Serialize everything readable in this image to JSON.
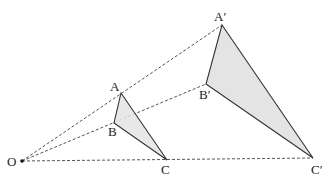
{
  "diagram": {
    "colors": {
      "fill": "#e4e4e4",
      "stroke": "#333333",
      "dash": "#555555"
    },
    "points": {
      "O": {
        "label": "O",
        "x": 22,
        "y": 161
      },
      "A": {
        "label": "A",
        "x": 121,
        "y": 93
      },
      "B": {
        "label": "B",
        "x": 114,
        "y": 123
      },
      "C": {
        "label": "C",
        "x": 167,
        "y": 160
      },
      "A_prime": {
        "label": "A′",
        "x": 222,
        "y": 25
      },
      "B_prime": {
        "label": "B′",
        "x": 206,
        "y": 84
      },
      "C_prime": {
        "label": "C′",
        "x": 313,
        "y": 158
      }
    },
    "rays": [
      "O-A′",
      "O-B′",
      "O-C′"
    ],
    "triangles": [
      "ABC",
      "A′B′C′"
    ]
  }
}
